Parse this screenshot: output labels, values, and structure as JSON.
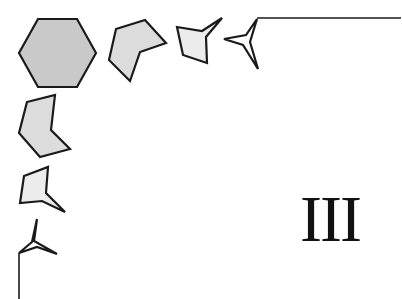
{
  "figure": {
    "label": "III",
    "colors": {
      "stroke": "#1a1a1a",
      "fill_dark": "#c9c9c9",
      "fill_mid": "#dcdcdc",
      "fill_light": "#ececec",
      "fill_none": "#ffffff",
      "background": "#ffffff"
    },
    "shapes": [
      {
        "name": "hexagon",
        "points": "38,19 77,19 96,53 77,87 38,87 19,53"
      },
      {
        "name": "concave-pentagon",
        "points": "116,29 145,20 166,43 140,52 130,81 109,60"
      },
      {
        "name": "arrow-quad",
        "points": "177,27 202,31 222,18 206,37 207,63 183,55"
      },
      {
        "name": "three-point-star-top",
        "points": "224,39 246,35 257,19 250,42 258,69 243,45"
      },
      {
        "name": "concave-hexagon",
        "points": "27,102 55,95 51,130 70,149 40,157 19,133"
      },
      {
        "name": "arrow-quad-left",
        "points": "24,176 48,167 46,193 65,212 42,201 20,203"
      },
      {
        "name": "three-point-star-left",
        "points": "37,219 34,241 57,254 37,247 19,253 32,242"
      }
    ],
    "lines": [
      {
        "name": "top-rule",
        "x1": 257,
        "y1": 18,
        "x2": 401,
        "y2": 18
      },
      {
        "name": "left-rule",
        "x1": 19,
        "y1": 253,
        "x2": 19,
        "y2": 299
      }
    ]
  }
}
